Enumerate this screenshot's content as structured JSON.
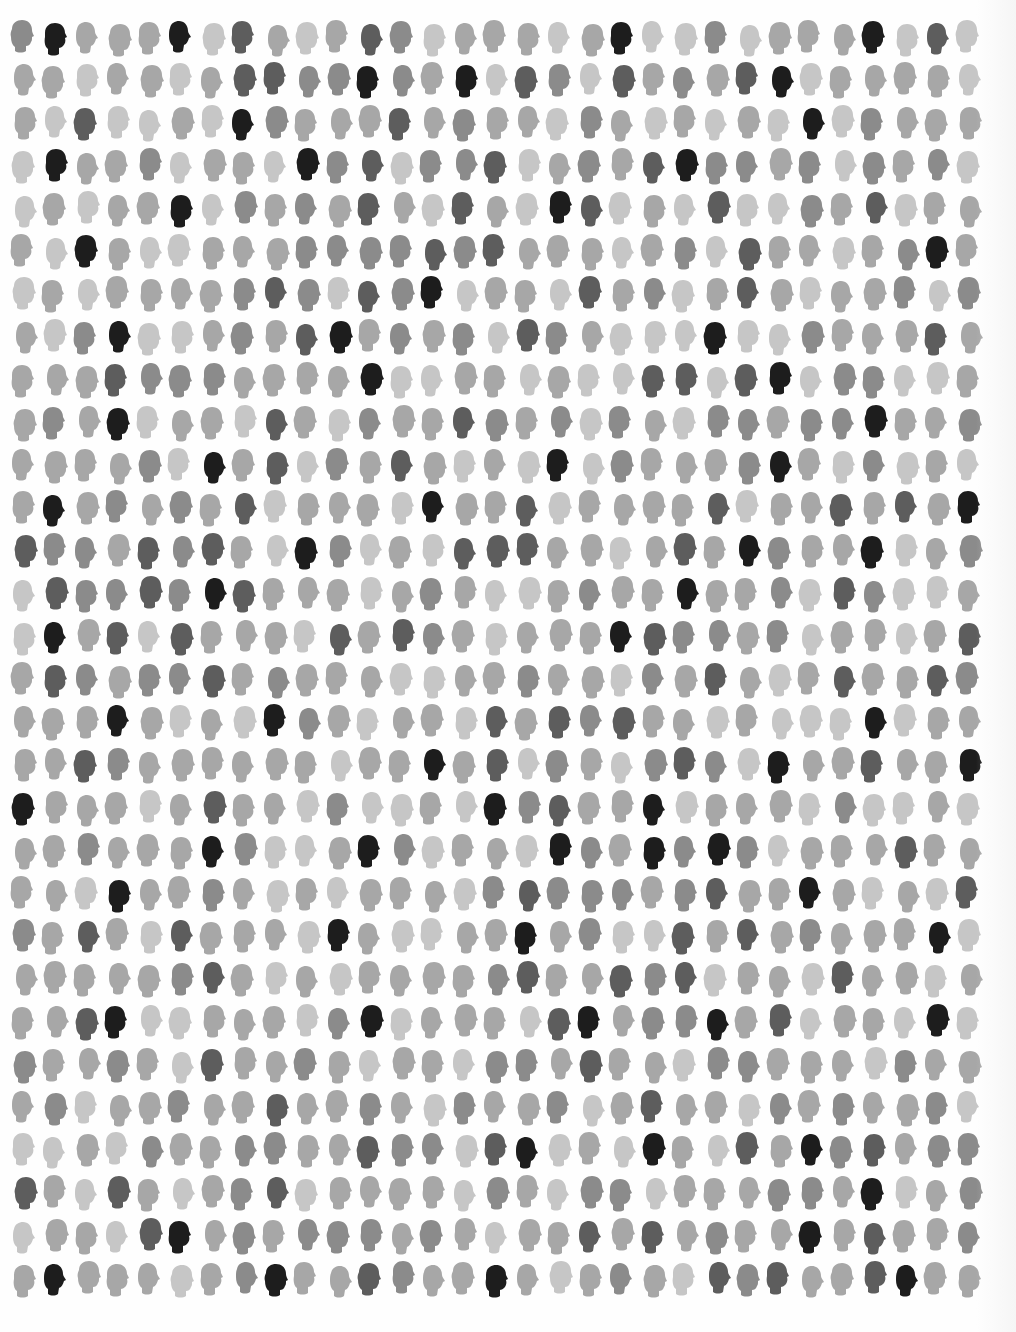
{
  "artwork": {
    "description": "Grid of head silhouettes in varying gray tones",
    "rows": 30,
    "columns": 31,
    "grid": {
      "origin_x": 22,
      "origin_y": 38,
      "col_pitch": 31.5,
      "row_pitch": 42.8,
      "head_width": 27,
      "head_height": 33
    },
    "palette": [
      "#c6c6c6",
      "#a7a7a7",
      "#8b8b8b",
      "#5d5d5d",
      "#1d1d1d"
    ],
    "levels": [
      [
        2,
        4,
        1,
        1,
        1,
        4,
        0,
        3,
        1,
        0,
        1,
        3,
        2,
        0,
        1,
        1,
        1,
        0,
        1,
        4,
        0,
        0,
        2,
        0,
        1,
        1,
        1,
        4,
        0,
        3,
        0
      ],
      [
        1,
        1,
        0,
        1,
        1,
        0,
        1,
        3,
        3,
        2,
        2,
        4,
        2,
        1,
        4,
        0,
        3,
        2,
        0,
        3,
        1,
        2,
        1,
        3,
        4,
        0,
        1,
        1,
        1,
        1,
        0
      ],
      [
        1,
        0,
        3,
        0,
        0,
        1,
        0,
        4,
        2,
        1,
        1,
        1,
        3,
        1,
        2,
        1,
        1,
        0,
        2,
        1,
        0,
        1,
        0,
        1,
        0,
        4,
        0,
        2,
        1,
        1,
        1
      ],
      [
        0,
        4,
        1,
        1,
        2,
        0,
        1,
        1,
        0,
        4,
        2,
        3,
        0,
        2,
        2,
        3,
        0,
        1,
        2,
        1,
        3,
        4,
        2,
        2,
        1,
        2,
        0,
        2,
        1,
        2,
        0
      ],
      [
        0,
        1,
        0,
        1,
        1,
        4,
        0,
        2,
        1,
        2,
        1,
        3,
        1,
        0,
        3,
        1,
        0,
        4,
        3,
        0,
        1,
        0,
        3,
        0,
        0,
        2,
        1,
        3,
        0,
        1,
        1
      ],
      [
        1,
        0,
        4,
        1,
        0,
        0,
        1,
        1,
        1,
        2,
        2,
        2,
        2,
        3,
        2,
        3,
        1,
        1,
        1,
        0,
        1,
        2,
        0,
        3,
        1,
        1,
        0,
        1,
        2,
        4,
        1
      ],
      [
        0,
        1,
        0,
        1,
        1,
        1,
        1,
        2,
        3,
        2,
        0,
        3,
        2,
        4,
        0,
        1,
        1,
        0,
        3,
        1,
        2,
        0,
        1,
        3,
        1,
        0,
        1,
        1,
        2,
        0,
        2
      ],
      [
        1,
        0,
        2,
        4,
        0,
        0,
        1,
        2,
        1,
        3,
        4,
        1,
        2,
        1,
        2,
        0,
        3,
        2,
        1,
        0,
        0,
        0,
        4,
        0,
        0,
        2,
        1,
        1,
        1,
        3,
        1
      ],
      [
        1,
        1,
        1,
        3,
        2,
        2,
        2,
        1,
        1,
        1,
        1,
        4,
        0,
        0,
        1,
        1,
        0,
        1,
        0,
        0,
        3,
        3,
        0,
        3,
        4,
        0,
        2,
        2,
        0,
        0,
        1
      ],
      [
        1,
        2,
        1,
        4,
        0,
        1,
        1,
        0,
        3,
        1,
        0,
        2,
        1,
        1,
        3,
        2,
        1,
        2,
        0,
        2,
        1,
        0,
        2,
        2,
        1,
        2,
        2,
        4,
        1,
        1,
        2
      ],
      [
        1,
        1,
        1,
        1,
        2,
        0,
        4,
        1,
        3,
        0,
        2,
        1,
        3,
        1,
        0,
        1,
        0,
        4,
        0,
        2,
        1,
        1,
        1,
        2,
        4,
        1,
        0,
        2,
        0,
        1,
        0
      ],
      [
        1,
        4,
        1,
        2,
        1,
        2,
        1,
        3,
        0,
        1,
        1,
        1,
        0,
        4,
        1,
        1,
        3,
        0,
        1,
        1,
        1,
        1,
        3,
        0,
        1,
        1,
        3,
        1,
        3,
        1,
        4
      ],
      [
        3,
        2,
        2,
        1,
        3,
        2,
        3,
        1,
        0,
        4,
        2,
        0,
        1,
        0,
        3,
        3,
        3,
        1,
        1,
        0,
        1,
        3,
        1,
        4,
        2,
        1,
        1,
        4,
        0,
        1,
        2
      ],
      [
        0,
        3,
        2,
        2,
        3,
        2,
        4,
        3,
        1,
        1,
        1,
        0,
        1,
        2,
        1,
        0,
        0,
        1,
        2,
        1,
        1,
        4,
        1,
        1,
        2,
        0,
        3,
        2,
        0,
        0,
        1
      ],
      [
        0,
        4,
        1,
        3,
        0,
        3,
        1,
        1,
        1,
        0,
        3,
        1,
        3,
        2,
        1,
        0,
        1,
        1,
        1,
        4,
        3,
        2,
        2,
        1,
        2,
        0,
        1,
        1,
        0,
        1,
        3
      ],
      [
        1,
        3,
        2,
        1,
        2,
        2,
        3,
        1,
        2,
        1,
        1,
        1,
        0,
        0,
        1,
        1,
        2,
        1,
        1,
        0,
        2,
        1,
        3,
        1,
        0,
        1,
        3,
        1,
        1,
        3,
        2
      ],
      [
        1,
        1,
        1,
        4,
        1,
        0,
        1,
        0,
        4,
        2,
        1,
        0,
        1,
        1,
        0,
        3,
        1,
        3,
        2,
        3,
        1,
        1,
        0,
        1,
        0,
        0,
        0,
        4,
        0,
        1,
        1
      ],
      [
        1,
        1,
        3,
        2,
        1,
        1,
        1,
        1,
        1,
        1,
        0,
        1,
        1,
        4,
        1,
        3,
        0,
        2,
        1,
        0,
        2,
        3,
        2,
        0,
        4,
        1,
        1,
        3,
        1,
        1,
        4
      ],
      [
        4,
        1,
        1,
        1,
        0,
        1,
        3,
        1,
        1,
        0,
        2,
        0,
        0,
        1,
        0,
        4,
        2,
        3,
        1,
        1,
        4,
        0,
        1,
        1,
        1,
        0,
        2,
        0,
        0,
        1,
        0
      ],
      [
        1,
        1,
        2,
        1,
        1,
        1,
        4,
        2,
        0,
        0,
        1,
        4,
        2,
        0,
        1,
        1,
        0,
        4,
        2,
        1,
        4,
        2,
        4,
        2,
        0,
        1,
        1,
        1,
        3,
        1,
        1
      ],
      [
        1,
        1,
        0,
        4,
        1,
        1,
        2,
        1,
        0,
        1,
        0,
        1,
        1,
        1,
        0,
        2,
        3,
        2,
        2,
        2,
        1,
        2,
        3,
        1,
        1,
        4,
        1,
        0,
        1,
        0,
        3
      ],
      [
        2,
        1,
        3,
        1,
        0,
        3,
        1,
        1,
        1,
        0,
        4,
        1,
        0,
        0,
        1,
        1,
        4,
        1,
        2,
        0,
        0,
        3,
        1,
        3,
        1,
        2,
        1,
        1,
        1,
        4,
        0
      ],
      [
        1,
        1,
        1,
        1,
        1,
        2,
        3,
        1,
        0,
        1,
        0,
        1,
        1,
        1,
        1,
        2,
        3,
        1,
        1,
        3,
        2,
        3,
        0,
        1,
        1,
        0,
        3,
        1,
        1,
        0,
        1
      ],
      [
        1,
        1,
        3,
        4,
        0,
        0,
        1,
        1,
        1,
        0,
        2,
        4,
        0,
        1,
        1,
        1,
        0,
        3,
        4,
        1,
        2,
        2,
        4,
        1,
        3,
        0,
        1,
        1,
        0,
        4,
        0
      ],
      [
        2,
        1,
        1,
        2,
        1,
        0,
        3,
        1,
        1,
        2,
        1,
        0,
        1,
        1,
        0,
        2,
        2,
        1,
        3,
        1,
        1,
        0,
        2,
        2,
        1,
        1,
        1,
        0,
        2,
        1,
        1
      ],
      [
        1,
        2,
        0,
        1,
        1,
        2,
        1,
        1,
        3,
        1,
        1,
        2,
        1,
        0,
        2,
        1,
        1,
        2,
        0,
        1,
        3,
        1,
        1,
        0,
        2,
        1,
        2,
        1,
        1,
        2,
        0
      ],
      [
        0,
        0,
        1,
        0,
        2,
        1,
        1,
        2,
        2,
        1,
        1,
        3,
        2,
        2,
        0,
        3,
        4,
        0,
        1,
        0,
        4,
        1,
        0,
        3,
        1,
        4,
        2,
        3,
        1,
        2,
        2
      ],
      [
        3,
        1,
        0,
        3,
        1,
        0,
        1,
        2,
        3,
        0,
        1,
        1,
        1,
        1,
        0,
        2,
        1,
        0,
        2,
        2,
        0,
        1,
        1,
        1,
        2,
        2,
        1,
        4,
        0,
        1,
        2
      ],
      [
        0,
        1,
        1,
        0,
        3,
        4,
        1,
        2,
        1,
        2,
        2,
        2,
        1,
        2,
        1,
        0,
        1,
        1,
        3,
        1,
        3,
        1,
        2,
        1,
        1,
        4,
        1,
        3,
        1,
        1,
        2
      ],
      [
        1,
        4,
        1,
        1,
        1,
        0,
        1,
        2,
        4,
        1,
        1,
        3,
        2,
        1,
        1,
        4,
        1,
        0,
        1,
        2,
        1,
        0,
        3,
        2,
        3,
        1,
        1,
        3,
        4,
        1,
        1
      ]
    ]
  }
}
